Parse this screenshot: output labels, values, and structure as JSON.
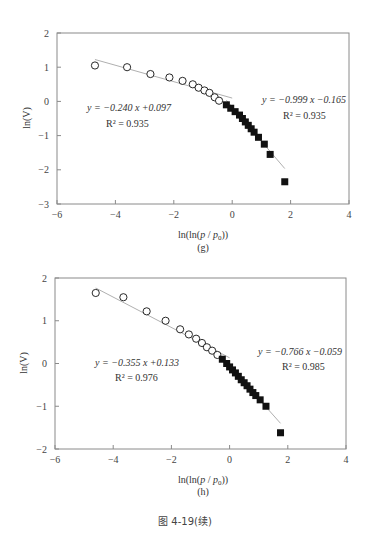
{
  "caption": "图 4-19(续)",
  "chart_data": [
    {
      "type": "scatter",
      "panel_label": "(g)",
      "xlabel": "ln(ln(p/p0))",
      "ylabel": "ln(V)",
      "xlim": [
        -6,
        4
      ],
      "ylim": [
        -3,
        2
      ],
      "xticks": [
        -6,
        -4,
        -2,
        0,
        2,
        4
      ],
      "yticks": [
        2,
        1,
        0,
        -1,
        -2,
        -3
      ],
      "grid": false,
      "legend": "none",
      "series": [
        {
          "name": "low-pressure region (open circles)",
          "marker": "circle-open",
          "x": [
            -4.7,
            -3.6,
            -2.8,
            -2.15,
            -1.7,
            -1.35,
            -1.15,
            -0.95,
            -0.78,
            -0.6,
            -0.45
          ],
          "y": [
            1.05,
            1.0,
            0.8,
            0.7,
            0.6,
            0.5,
            0.4,
            0.32,
            0.25,
            0.12,
            0.02
          ],
          "fit": {
            "equation": "y = -0.240 x +0.097",
            "r2": "R² = 0.935",
            "slope": -0.24,
            "intercept": 0.097,
            "x_range": [
              -4.7,
              0.0
            ]
          }
        },
        {
          "name": "high-pressure region (filled squares)",
          "marker": "square-filled",
          "x": [
            -0.2,
            -0.05,
            0.1,
            0.25,
            0.35,
            0.45,
            0.55,
            0.65,
            0.75,
            0.9,
            1.1,
            1.3,
            1.8
          ],
          "y": [
            -0.1,
            -0.2,
            -0.3,
            -0.4,
            -0.5,
            -0.6,
            -0.7,
            -0.8,
            -0.9,
            -1.05,
            -1.25,
            -1.55,
            -2.35
          ],
          "fit": {
            "equation": "y = -0.999 x -0.165",
            "r2": "R² = 0.935",
            "slope": -0.999,
            "intercept": -0.165,
            "x_range": [
              -0.2,
              1.8
            ]
          }
        }
      ]
    },
    {
      "type": "scatter",
      "panel_label": "(h)",
      "xlabel": "ln(ln(p/p0))",
      "ylabel": "ln(V)",
      "xlim": [
        -6,
        4
      ],
      "ylim": [
        -2,
        2
      ],
      "xticks": [
        -6,
        -4,
        -2,
        0,
        2,
        4
      ],
      "yticks": [
        2,
        1,
        0,
        -1,
        -2
      ],
      "grid": false,
      "legend": "none",
      "series": [
        {
          "name": "low-pressure region (open circles)",
          "marker": "circle-open",
          "x": [
            -4.6,
            -3.65,
            -2.85,
            -2.2,
            -1.7,
            -1.4,
            -1.15,
            -0.95,
            -0.78,
            -0.6,
            -0.42
          ],
          "y": [
            1.65,
            1.55,
            1.22,
            1.0,
            0.8,
            0.68,
            0.58,
            0.48,
            0.38,
            0.3,
            0.2
          ],
          "fit": {
            "equation": "y = -0.355 x +0.133",
            "r2": "R² = 0.976",
            "slope": -0.355,
            "intercept": 0.133,
            "x_range": [
              -4.6,
              0.0
            ]
          }
        },
        {
          "name": "high-pressure region (filled squares)",
          "marker": "square-filled",
          "x": [
            -0.25,
            -0.1,
            0.0,
            0.1,
            0.2,
            0.3,
            0.4,
            0.5,
            0.6,
            0.7,
            0.8,
            0.9,
            1.05,
            1.25,
            1.75
          ],
          "y": [
            0.1,
            0.0,
            -0.08,
            -0.15,
            -0.22,
            -0.3,
            -0.38,
            -0.45,
            -0.52,
            -0.6,
            -0.68,
            -0.75,
            -0.85,
            -1.0,
            -1.62
          ],
          "fit": {
            "equation": "y = -0.766 x -0.059",
            "r2": "R² = 0.985",
            "slope": -0.766,
            "intercept": -0.059,
            "x_range": [
              -0.25,
              1.75
            ]
          }
        }
      ]
    }
  ],
  "labels": {
    "g": {
      "ylabel": "ln(V)",
      "xlabel_prefix": "ln(ln(",
      "xlabel_p": "p",
      "xlabel_sep": " / ",
      "xlabel_p0": "p",
      "xlabel_sub": "0",
      "xlabel_suffix": "))",
      "panel": "(g)",
      "eq_left": "y = −0.240 x +0.097",
      "r2_left": "R² = 0.935",
      "eq_right": "y = −0.999 x −0.165",
      "r2_right": "R² = 0.935",
      "xticks": [
        "−6",
        "−4",
        "−2",
        "0",
        "2",
        "4"
      ],
      "yticks": [
        "2",
        "1",
        "0",
        "−1",
        "−2",
        "−3"
      ]
    },
    "h": {
      "ylabel": "ln(V)",
      "xlabel_prefix": "ln(ln(",
      "xlabel_p": "p",
      "xlabel_sep": " / ",
      "xlabel_p0": "p",
      "xlabel_sub": "0",
      "xlabel_suffix": "))",
      "panel": "(h)",
      "eq_left": "y = −0.355 x +0.133",
      "r2_left": "R² = 0.976",
      "eq_right": "y = −0.766 x −0.059",
      "r2_right": "R² = 0.985",
      "xticks": [
        "−6",
        "−4",
        "−2",
        "0",
        "2",
        "4"
      ],
      "yticks": [
        "2",
        "1",
        "0",
        "−1",
        "−2"
      ]
    }
  },
  "colors": {
    "frame": "#8a8a8a",
    "fit_line": "#9a9a9a",
    "marker": "#111111",
    "text": "#333333"
  }
}
